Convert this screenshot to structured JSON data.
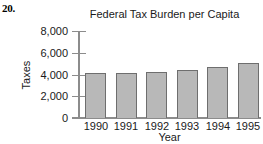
{
  "problem": {
    "number": "20."
  },
  "chart_data": {
    "type": "bar",
    "title": "Federal Tax Burden per Capita",
    "xlabel": "Year",
    "ylabel": "Taxes",
    "categories": [
      "1990",
      "1991",
      "1992",
      "1993",
      "1994",
      "1995"
    ],
    "values": [
      4100,
      4100,
      4200,
      4400,
      4700,
      5050
    ],
    "ylim": [
      0,
      8000
    ],
    "ytick_step": 2000,
    "ytick_labels": [
      "0",
      "2,000",
      "4,000",
      "6,000",
      "8,000"
    ],
    "ytick_values": [
      0,
      2000,
      4000,
      6000,
      8000
    ],
    "grid": false,
    "legend": "none",
    "bar_fill_color": "#b8b8b8",
    "bar_border_color": "#6e6e6e",
    "axis_color": "#8c8c8c"
  }
}
